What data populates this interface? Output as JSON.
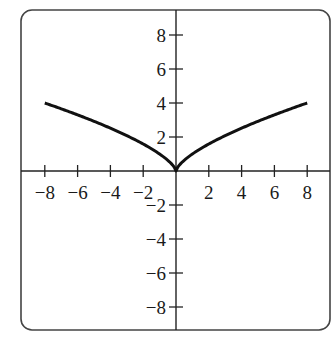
{
  "chart_data": {
    "type": "line",
    "title": "",
    "xlabel": "",
    "ylabel": "",
    "xlim": [
      -8,
      8
    ],
    "ylim": [
      -8,
      8
    ],
    "grid": false,
    "x_ticks": [
      -8,
      -6,
      -4,
      -2,
      2,
      4,
      6,
      8
    ],
    "y_ticks": [
      -8,
      -6,
      -4,
      -2,
      2,
      4,
      6,
      8
    ],
    "x_tick_labels": [
      "−8",
      "−6",
      "−4",
      "−2",
      "2",
      "4",
      "6",
      "8"
    ],
    "y_tick_labels": [
      "−8",
      "−6",
      "−4",
      "−2",
      "2",
      "4",
      "6",
      "8"
    ],
    "series": [
      {
        "name": "y = |x|^(2/3)",
        "x": [
          -8,
          -6,
          -4,
          -2,
          -1,
          0,
          1,
          2,
          4,
          6,
          8
        ],
        "values": [
          4,
          3.3,
          2.52,
          1.59,
          1,
          0,
          1,
          1.59,
          2.52,
          3.3,
          4
        ]
      }
    ],
    "colors": {
      "curve": "#111111",
      "axes": "#222222",
      "frame": "#444444"
    }
  },
  "layout": {
    "frame": {
      "x": 21,
      "y": 10,
      "w": 309,
      "h": 320,
      "r": 11
    },
    "origin": {
      "px": 176,
      "py": 171
    },
    "scale": {
      "x": 16.4,
      "y": 17.0
    }
  }
}
